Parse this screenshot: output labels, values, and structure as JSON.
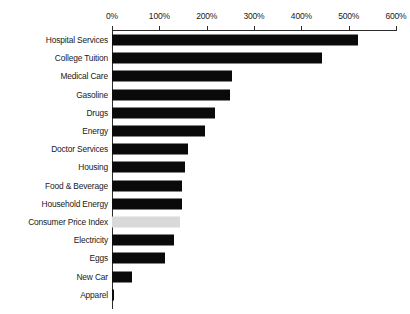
{
  "chart_data": {
    "type": "bar",
    "orientation": "horizontal",
    "title": "",
    "xlabel": "",
    "ylabel": "",
    "xlim": [
      0,
      600
    ],
    "grid": false,
    "legend": null,
    "tick_labels": [
      "0%",
      "100%",
      "200%",
      "300%",
      "400%",
      "500%",
      "600%"
    ],
    "tick_values": [
      0,
      100,
      200,
      300,
      400,
      500,
      600
    ],
    "categories": [
      "Hospital Services",
      "College Tuition",
      "Medical Care",
      "Gasoline",
      "Drugs",
      "Energy",
      "Doctor Services",
      "Housing",
      "Food & Beverage",
      "Household Energy",
      "Consumer Price Index",
      "Electricity",
      "Eggs",
      "New Car",
      "Apparel"
    ],
    "values": [
      520,
      444,
      254,
      250,
      218,
      196,
      161,
      154,
      148,
      147,
      144,
      131,
      112,
      42,
      5
    ],
    "highlight_category": "Consumer Price Index",
    "colors": {
      "bar": "#0a0a0a",
      "highlight_bar": "#d9d9d9",
      "axis": "#2b2b2b",
      "text": "#1a1a1a",
      "background": "#ffffff"
    }
  }
}
